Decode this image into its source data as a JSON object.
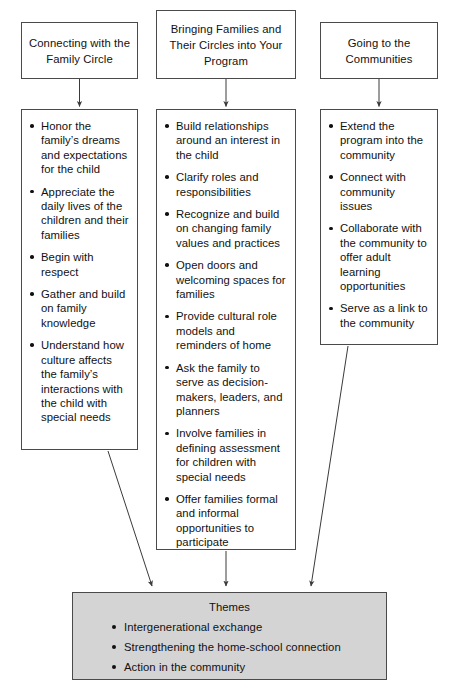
{
  "diagram": {
    "type": "flowchart",
    "columns": [
      {
        "id": "column-1",
        "header": "Connecting with the Family Circle",
        "items": [
          "Honor the family’s dreams and expectations for the child",
          "Appreciate the daily lives of the children and their families",
          "Begin with respect",
          "Gather and build on family knowledge",
          "Understand how culture affects the family’s interactions with the child with special needs"
        ]
      },
      {
        "id": "column-2",
        "header": "Bringing Families and Their Circles into Your Program",
        "items": [
          "Build relationships around an interest in the child",
          "Clarify roles and responsibilities",
          "Recognize and build on changing family values and practices",
          "Open doors and welcoming spaces for families",
          "Provide cultural role models and reminders of home",
          "Ask the family to serve as decision-makers, leaders, and planners",
          "Involve families in defining assessment for children with special needs",
          "Offer families formal and informal opportunities to participate"
        ]
      },
      {
        "id": "column-3",
        "header": "Going to the Communities",
        "items": [
          "Extend the program into the community",
          "Connect with community issues",
          "Collaborate with the community to offer adult learning opportunities",
          "Serve as a link to the community"
        ]
      }
    ],
    "themes": {
      "title": "Themes",
      "items": [
        "Intergenerational exchange",
        "Strengthening the home-school connection",
        "Action in the community"
      ]
    },
    "colors": {
      "border": "#4a4a4a",
      "text": "#111111",
      "themes_fill": "#d4d4d4",
      "arrow": "#3a3a3a",
      "background": "#ffffff"
    }
  }
}
